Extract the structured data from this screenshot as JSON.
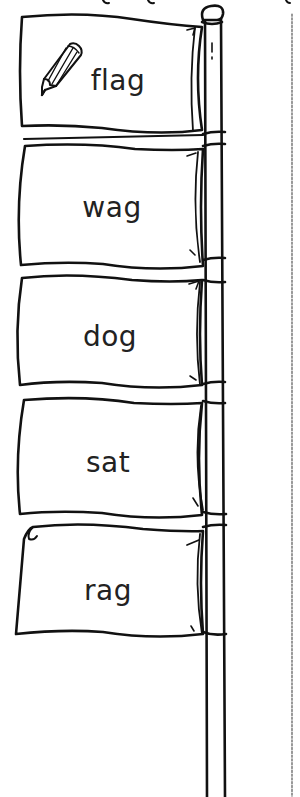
{
  "worksheet": {
    "title_partial": "",
    "pole": {
      "stroke_color": "#111111",
      "fill_color": "#ffffff"
    },
    "cut_line": {
      "style": "dashed",
      "color": "#555555"
    },
    "flags": [
      {
        "word": "flag",
        "icon": "pencil-icon"
      },
      {
        "word": "wag"
      },
      {
        "word": "dog"
      },
      {
        "word": "sat"
      },
      {
        "word": "rag"
      }
    ]
  }
}
